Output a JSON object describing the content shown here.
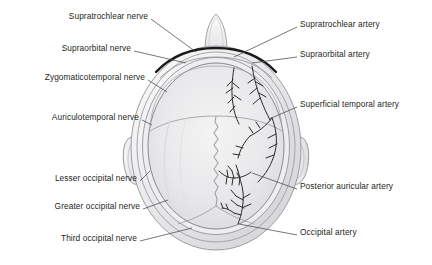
{
  "figure": {
    "view": "superior (top-down) view of head with nose at top",
    "background_color": "#ffffff",
    "label_color": "#231f20",
    "leader_color": "#4a4a4a",
    "scalp_fill": "#ededee",
    "scalp_inner_fill": "#e4e4e6",
    "outline_color": "#8c8c90",
    "artery_color": "#2b2b2b",
    "ridge_color": "#1a1a1a"
  },
  "labels": {
    "left": [
      {
        "id": "supratrochlear-nerve",
        "text": "Supratrochlear nerve",
        "x": 148,
        "y": 16,
        "lx": 151,
        "ly": 19,
        "tx": 196,
        "ty": 52
      },
      {
        "id": "supraorbital-nerve",
        "text": "Supraorbital nerve",
        "x": 131,
        "y": 48,
        "lx": 134,
        "ly": 51,
        "tx": 186,
        "ty": 63
      },
      {
        "id": "zygomaticotemporal-nerve",
        "text": "Zygomaticotemporal nerve",
        "x": 145,
        "y": 77,
        "lx": 148,
        "ly": 80,
        "tx": 167,
        "ty": 92
      },
      {
        "id": "auriculotemporal-nerve",
        "text": "Auriculotemporal nerve",
        "x": 139,
        "y": 117,
        "lx": 142,
        "ly": 120,
        "tx": 150,
        "ty": 125
      },
      {
        "id": "lesser-occipital-nerve",
        "text": "Lesser occipital nerve",
        "x": 137,
        "y": 178,
        "lx": 140,
        "ly": 181,
        "tx": 148,
        "ty": 170
      },
      {
        "id": "greater-occipital-nerve",
        "text": "Greater occipital nerve",
        "x": 140,
        "y": 206,
        "lx": 143,
        "ly": 209,
        "tx": 166,
        "ty": 200
      },
      {
        "id": "third-occipital-nerve",
        "text": "Third occipital nerve",
        "x": 137,
        "y": 238,
        "lx": 140,
        "ly": 241,
        "tx": 190,
        "ty": 228
      }
    ],
    "right": [
      {
        "id": "supratrochlear-artery",
        "text": "Supratrochlear artery",
        "x": 300,
        "y": 24,
        "lx": 297,
        "ly": 27,
        "tx": 234,
        "ty": 56
      },
      {
        "id": "supraorbital-artery",
        "text": "Supraorbital artery",
        "x": 300,
        "y": 54,
        "lx": 297,
        "ly": 57,
        "tx": 252,
        "ty": 62
      },
      {
        "id": "superficial-temporal-artery",
        "text": "Superficial temporal artery",
        "x": 300,
        "y": 104,
        "lx": 297,
        "ly": 107,
        "tx": 268,
        "ty": 120
      },
      {
        "id": "posterior-auricular-artery",
        "text": "Posterior auricular artery",
        "x": 300,
        "y": 186,
        "lx": 297,
        "ly": 189,
        "tx": 251,
        "ty": 172
      },
      {
        "id": "occipital-artery",
        "text": "Occipital artery",
        "x": 300,
        "y": 232,
        "lx": 297,
        "ly": 235,
        "tx": 238,
        "ty": 224
      }
    ]
  },
  "anatomy": {
    "structures": [
      "nose",
      "left ear",
      "right ear",
      "scalp outer margin",
      "galea aponeurotica",
      "coronal suture",
      "sagittal suture",
      "lambdoid suture",
      "supraorbital ridge"
    ],
    "arterial_side": "right half of image (subject's left)",
    "nerve_side": "left half of image (subject's right)"
  }
}
